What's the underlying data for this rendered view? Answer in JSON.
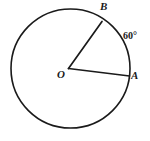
{
  "figure": {
    "type": "circle-central-angle-diagram",
    "background_color": "#ffffff",
    "stroke_color": "#1a1a1a",
    "text_color": "#1a1a1a",
    "circle": {
      "center_x": 70.5,
      "center_y": 68.5,
      "radius": 59.5
    },
    "center_point": {
      "x": 68.5,
      "y": 68.5
    },
    "radii": [
      {
        "name": "radius-OB",
        "from_x": 68.5,
        "from_y": 68.5,
        "to_x": 102,
        "to_y": 21.5
      },
      {
        "name": "radius-OA",
        "from_x": 68.5,
        "from_y": 68.5,
        "to_x": 129.5,
        "to_y": 76
      }
    ],
    "labels": {
      "point_b": "B",
      "point_a": "A",
      "center": "O",
      "angle": "60°"
    }
  }
}
